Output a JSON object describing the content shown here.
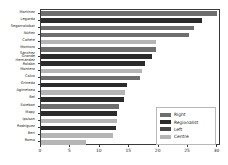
{
  "chart_data": {
    "type": "bar",
    "orientation": "horizontal",
    "title": "",
    "xlabel": "",
    "ylabel": "",
    "xlim": [
      0,
      30.6
    ],
    "xticks": [
      0,
      5,
      10,
      15,
      20,
      25,
      30
    ],
    "xtick_labels": [
      "0",
      "5",
      "10",
      "15",
      "20",
      "25",
      "30"
    ],
    "grid": false,
    "legend_position": "lower right",
    "categories": [
      "Martínez",
      "Legarda",
      "Segarraloibat",
      "Núñez",
      "Cañete",
      "Montoro",
      "Sánchez\nGrande",
      "Hernández\nRoldán",
      "Montero",
      "Calvo",
      "Grineda",
      "Agirretxea",
      "Bel",
      "Esteban",
      "Mapy",
      "Ipsison",
      "Rodríguez",
      "Beri",
      "Roma"
    ],
    "values": [
      30.0,
      27.4,
      26.0,
      25.1,
      19.6,
      19.5,
      18.9,
      17.6,
      17.1,
      16.8,
      14.7,
      14.3,
      14.1,
      13.2,
      13.0,
      12.9,
      12.8,
      12.3,
      7.6
    ],
    "group_of_bar": [
      "Right",
      "Regionalist",
      "Right",
      "Right",
      "Centre",
      "Right",
      "Regionalist",
      "Regionalist",
      "Centre",
      "Right",
      "Regionalist",
      "Centre",
      "Regionalist",
      "Right",
      "Regionalist",
      "Centre",
      "Regionalist",
      "Centre",
      "Centre"
    ],
    "series": [
      {
        "name": "Right",
        "color": "#6e6e6e"
      },
      {
        "name": "Regionalist",
        "color": "#2b2b2b"
      },
      {
        "name": "Left",
        "color": "#474747"
      },
      {
        "name": "Centre",
        "color": "#b5b5b5"
      }
    ],
    "legend": [
      "Right",
      "Regionalist",
      "Left",
      "Centre"
    ]
  }
}
